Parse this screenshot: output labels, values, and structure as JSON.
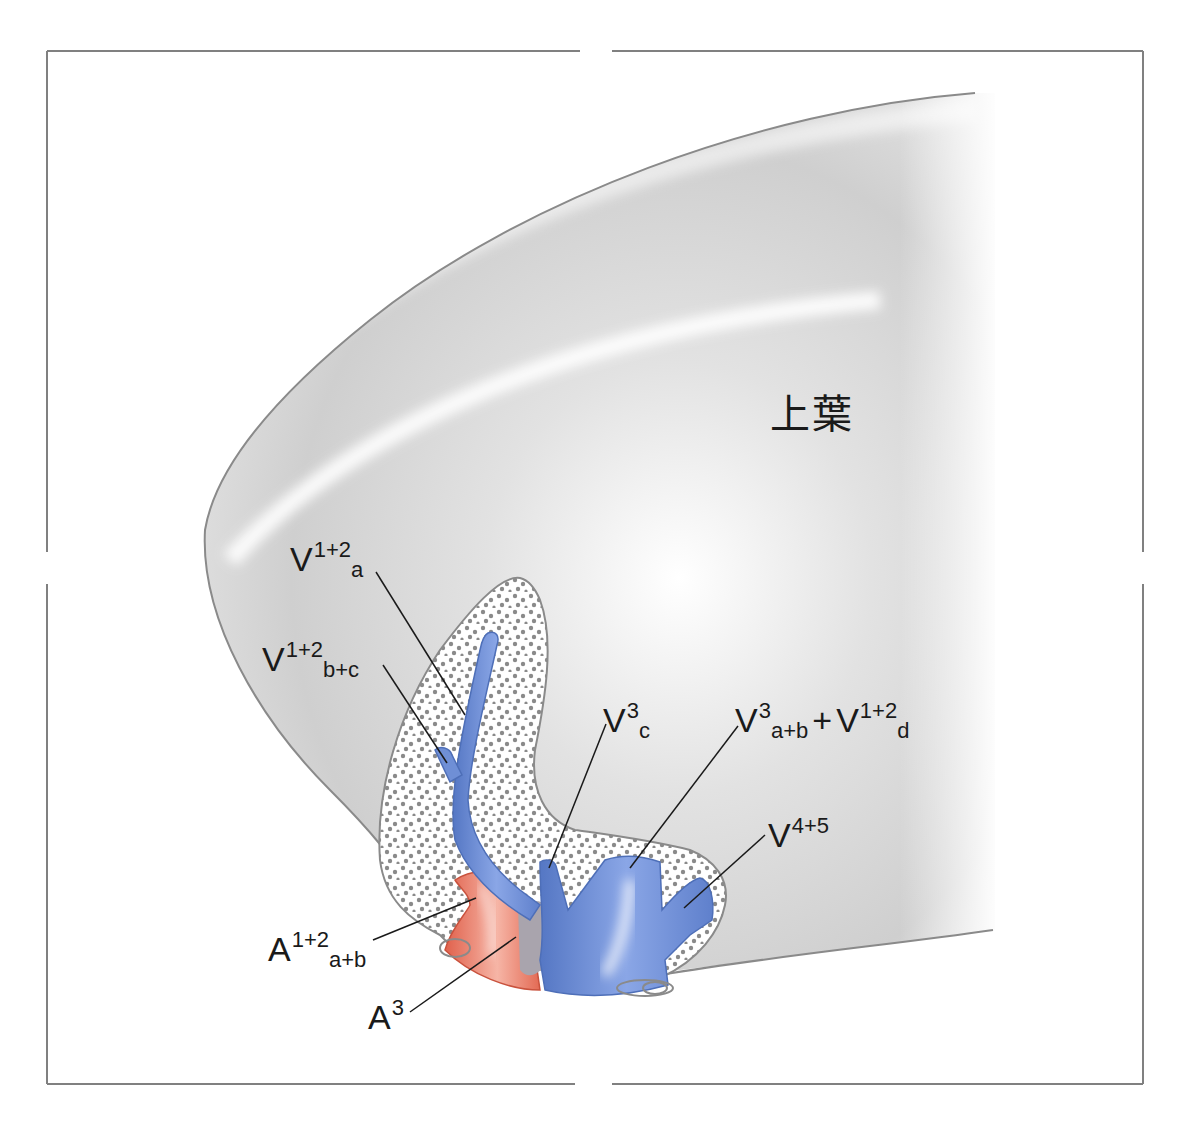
{
  "diagram": {
    "lobe_label": "上葉",
    "colors": {
      "lobe_fill": "#d4d4d4",
      "lobe_outline": "#8a8a8a",
      "frame": "#808080",
      "vein": "#6f8fd6",
      "vein_dark": "#4e6fb8",
      "artery": "#e8705a",
      "artery_dark": "#c9523d",
      "stipple_dot": "#8a8a8a",
      "bronchus_overlap": "#a9a4ad",
      "leader_line": "#1a1a1a"
    },
    "labels": [
      {
        "id": "v12a",
        "base": "V",
        "sup": "1+2",
        "sub": "a"
      },
      {
        "id": "v12bc",
        "base": "V",
        "sup": "1+2",
        "sub": "b+c"
      },
      {
        "id": "v3c",
        "base": "V",
        "sup": "3",
        "sub": "c"
      },
      {
        "id": "v3ab_v12d",
        "base": "V",
        "sup": "3",
        "sub": "a+b",
        "plus": "+",
        "base2": "V",
        "sup2": "1+2",
        "sub2": "d"
      },
      {
        "id": "v45",
        "base": "V",
        "sup": "4+5",
        "sub": ""
      },
      {
        "id": "a12ab",
        "base": "A",
        "sup": "1+2",
        "sub": "a+b"
      },
      {
        "id": "a3",
        "base": "A",
        "sup": "3",
        "sub": ""
      }
    ]
  }
}
